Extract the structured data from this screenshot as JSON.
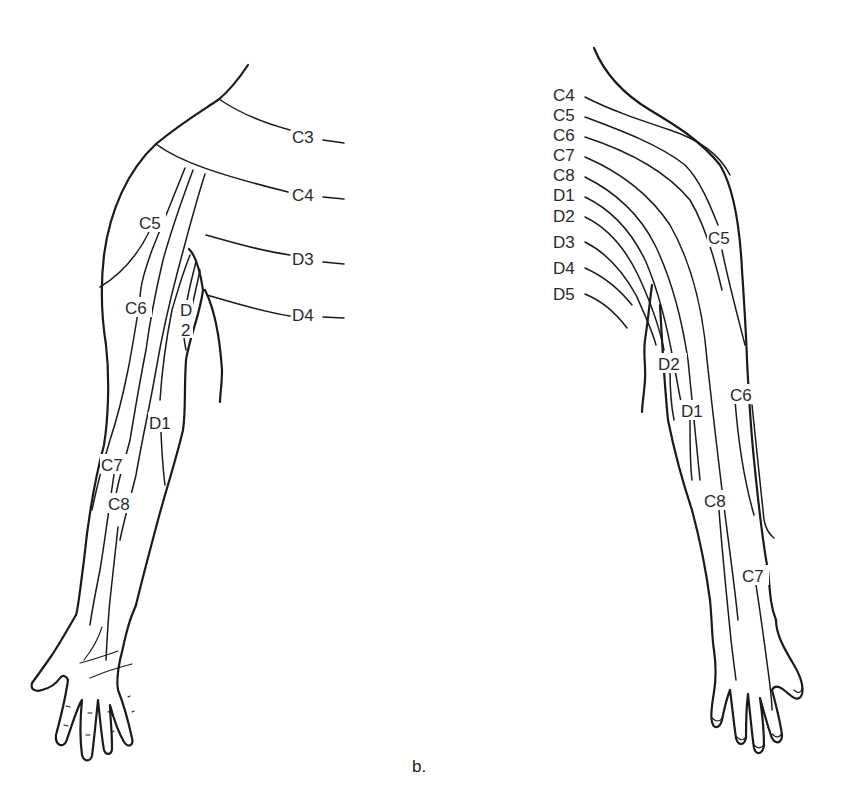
{
  "figure": {
    "caption": "b.",
    "colors": {
      "ink": "#1a1a1a",
      "background": "#ffffff"
    }
  },
  "anterior_arm": {
    "labels": {
      "c3": "C3",
      "c4": "C4",
      "d3": "D3",
      "d4": "D4",
      "c5": "C5",
      "c6": "C6",
      "d2_top": "D",
      "d2_bottom": "2",
      "d1": "D1",
      "c7": "C7",
      "c8": "C8"
    }
  },
  "posterior_arm": {
    "labels": {
      "c4": "C4",
      "c5": "C5",
      "c6": "C6",
      "c7": "C7",
      "c8": "C8",
      "d1": "D1",
      "d2": "D2",
      "d3": "D3",
      "d4": "D4",
      "d5": "D5",
      "c5_arm": "C5",
      "d2_arm": "D2",
      "d1_arm": "D1",
      "c6_arm": "C6",
      "c8_arm": "C8",
      "c7_arm": "C7"
    }
  }
}
